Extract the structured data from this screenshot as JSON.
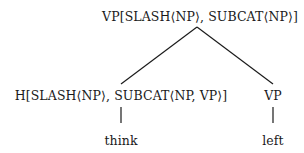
{
  "tree": {
    "root": {
      "label": "VP[SLASH⟨NP⟩, SUBCAT⟨NP⟩]"
    },
    "children": [
      {
        "label": "H[SLASH⟨NP⟩, SUBCAT⟨NP, VP⟩]",
        "leaf": "think"
      },
      {
        "label": "VP",
        "leaf": "left"
      }
    ]
  },
  "colors": {
    "text": "#1a1a1a",
    "lines": "#1a1a1a",
    "background": "#ffffff"
  }
}
